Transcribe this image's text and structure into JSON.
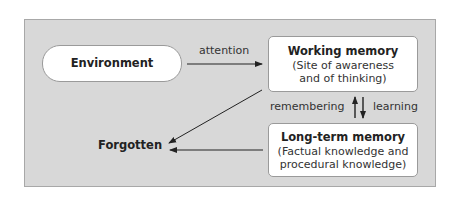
{
  "diagram": {
    "nodes": {
      "environment": {
        "title": "Environment"
      },
      "working_memory": {
        "title": "Working memory",
        "subtitle_lines": [
          "(Site of awareness",
          "and of thinking)"
        ]
      },
      "long_term_memory": {
        "title": "Long-term memory",
        "subtitle_lines": [
          "(Factual knowledge and",
          "procedural knowledge)"
        ]
      },
      "forgotten": {
        "title": "Forgotten"
      }
    },
    "edges": [
      {
        "from": "Environment",
        "to": "Working memory",
        "label": "attention"
      },
      {
        "from": "Long-term memory",
        "to": "Working memory",
        "label": "remembering"
      },
      {
        "from": "Working memory",
        "to": "Long-term memory",
        "label": "learning"
      },
      {
        "from": "Working memory",
        "to": "Forgotten",
        "label": ""
      },
      {
        "from": "Long-term memory",
        "to": "Forgotten",
        "label": ""
      }
    ],
    "colors": {
      "panel_bg": "#d8d8d8",
      "node_bg": "#ffffff",
      "arrow": "#222222"
    }
  }
}
